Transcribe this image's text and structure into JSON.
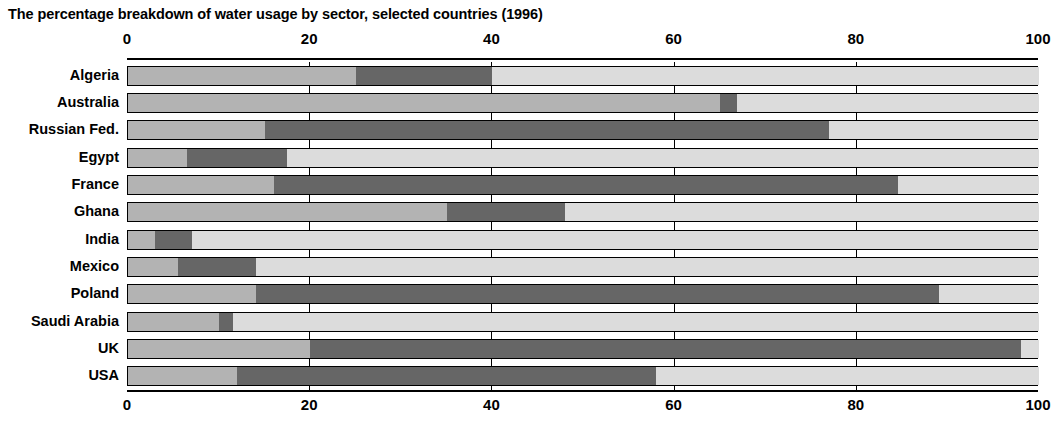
{
  "chart_data": {
    "type": "bar",
    "subtype": "stacked-horizontal-100",
    "title": "The percentage breakdown of water usage by sector, selected countries (1996)",
    "xlabel": "",
    "ylabel": "",
    "xlim": [
      0,
      100
    ],
    "xticks": [
      0,
      20,
      40,
      60,
      80,
      100
    ],
    "xtick_labels": [
      "0",
      "20",
      "40",
      "60",
      "80",
      "100"
    ],
    "axis_top": true,
    "axis_bottom": true,
    "grid": true,
    "legend": false,
    "categories": [
      "Algeria",
      "Australia",
      "Russian Fed.",
      "Egypt",
      "France",
      "Ghana",
      "India",
      "Mexico",
      "Poland",
      "Saudi Arabia",
      "UK",
      "USA"
    ],
    "series": [
      {
        "name": "Sector 1",
        "color": "#b3b3b3",
        "values": [
          25,
          65,
          15,
          6.5,
          16,
          35,
          3,
          5.5,
          14,
          10,
          20,
          12
        ]
      },
      {
        "name": "Sector 2",
        "color": "#666666",
        "values": [
          15,
          1.8,
          62,
          11,
          68.5,
          13,
          4,
          8.5,
          75,
          1.5,
          78,
          46
        ]
      },
      {
        "name": "Sector 3",
        "color": "#dcdcdc",
        "values": [
          60,
          33.2,
          23,
          82.5,
          15.5,
          52,
          93,
          86,
          11,
          88.5,
          2,
          42
        ]
      }
    ],
    "cumulative_boundaries": [
      [
        25,
        40
      ],
      [
        65,
        66.8
      ],
      [
        15,
        77
      ],
      [
        6.5,
        17.5
      ],
      [
        16,
        84.5
      ],
      [
        35,
        48
      ],
      [
        3,
        7
      ],
      [
        5.5,
        14
      ],
      [
        14,
        89
      ],
      [
        10,
        11.5
      ],
      [
        20,
        98
      ],
      [
        12,
        58
      ]
    ]
  }
}
